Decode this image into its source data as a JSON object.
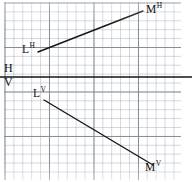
{
  "figure": {
    "kind": "descriptive-geometry-projection",
    "background": "#ffffff",
    "ink_color": "#141414",
    "grid": {
      "minor_color": "#afb6c0",
      "major_color": "#828a96",
      "minor_spacing_px": 8.9,
      "major_every": 5
    },
    "ground_line": {
      "name": "XY",
      "upper_label": "H",
      "lower_label": "V",
      "y": 77,
      "x_start": 0,
      "x_end": 192
    },
    "labels": {
      "MH": {
        "base": "M",
        "sup": "H"
      },
      "LH": {
        "base": "L",
        "sup": "H"
      },
      "LV": {
        "base": "L",
        "sup": "V"
      },
      "MV": {
        "base": "M",
        "sup": "V"
      },
      "H": "H",
      "V": "V"
    },
    "segments": [
      {
        "name": "horizontal-projection",
        "from_label": "LH",
        "to_label": "MH",
        "x1": 38,
        "y1": 52,
        "x2": 143,
        "y2": 11
      },
      {
        "name": "vertical-projection",
        "from_label": "LV",
        "to_label": "MV",
        "x1": 44,
        "y1": 100,
        "x2": 153,
        "y2": 165
      }
    ]
  }
}
